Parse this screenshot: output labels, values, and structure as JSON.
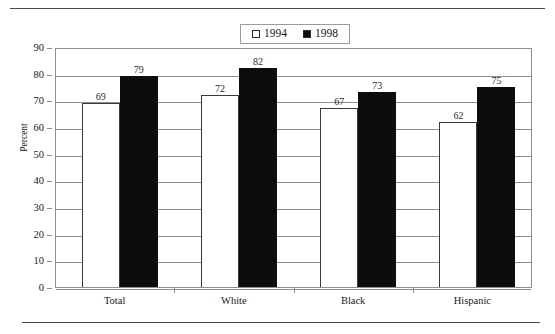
{
  "chart_data": {
    "type": "bar",
    "title": "",
    "subtitle": "",
    "xlabel": "",
    "ylabel": "Percent",
    "ylim": [
      0,
      90
    ],
    "ytick_step": 10,
    "yticks": [
      "0",
      "10",
      "20",
      "30",
      "40",
      "50",
      "60",
      "70",
      "80",
      "90"
    ],
    "grid": "horizontal",
    "legend_position": "top-center",
    "categories": [
      "Total",
      "White",
      "Black",
      "Hispanic"
    ],
    "series": [
      {
        "name": "1994",
        "marker": "hollow-square",
        "color": "#ffffff",
        "border_color": "#3a3a3a",
        "values": [
          69,
          72,
          67,
          62
        ],
        "labels": [
          "69",
          "72",
          "67",
          "62"
        ]
      },
      {
        "name": "1998",
        "marker": "filled-square",
        "color": "#0d0d0d",
        "border_color": "#0d0d0d",
        "values": [
          79,
          82,
          73,
          75
        ],
        "labels": [
          "79",
          "82",
          "73",
          "75"
        ]
      }
    ],
    "annotations": []
  },
  "legend": {
    "entries": [
      {
        "label": "1994",
        "swatch": "hollow-square"
      },
      {
        "label": "1998",
        "swatch": "filled-square"
      }
    ]
  },
  "colors": {
    "series_1994_fill": "#ffffff",
    "series_1998_fill": "#0d0d0d",
    "axis": "#8e8e8e",
    "rule": "#4a4a4a",
    "text": "#1a1a1a"
  }
}
